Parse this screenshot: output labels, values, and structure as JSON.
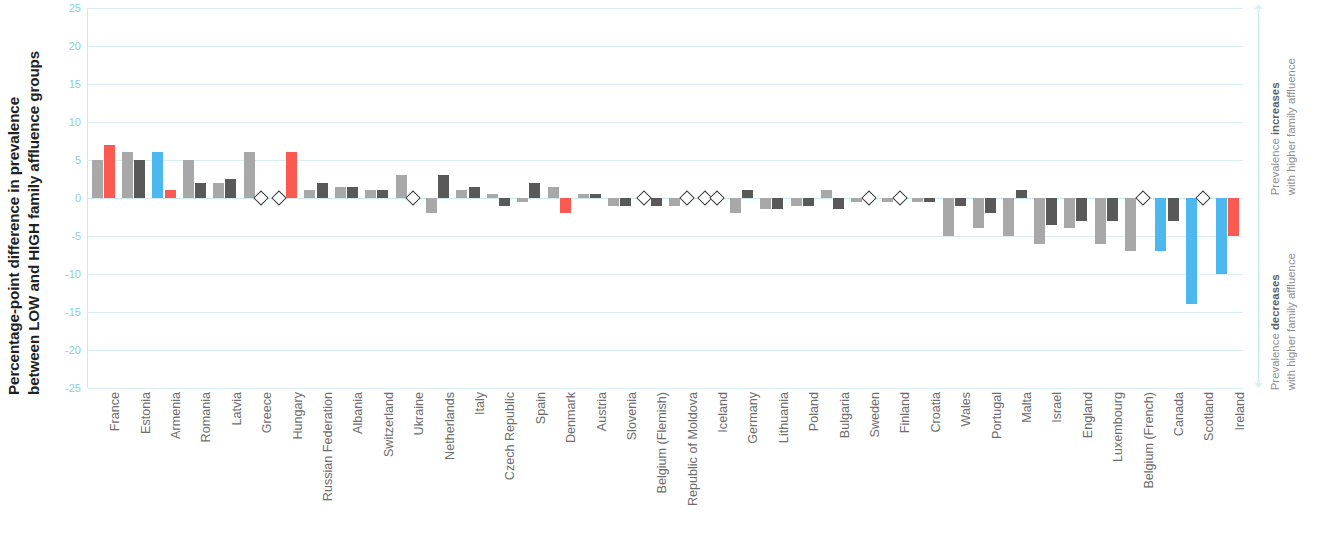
{
  "axis_title": {
    "line1": "Percentage-point difference in prevalence",
    "line2": "between LOW and HIGH family affluence groups"
  },
  "y_axis": {
    "ticks": [
      "25",
      "20",
      "15",
      "10",
      "5",
      "0",
      "-5",
      "-10",
      "-15",
      "-20",
      "-25"
    ],
    "min": -25,
    "max": 25,
    "step": 5
  },
  "annotations": {
    "top_line1_pre": "Prevalence ",
    "top_line1_bold": "increases",
    "top_line2": "with higher family affluence",
    "bottom_line1_pre": "Prevalence ",
    "bottom_line1_bold": "decreases",
    "bottom_line2": "with higher family affluence",
    "up_arrow_icon": "arrow-up-icon",
    "down_arrow_icon": "arrow-down-icon"
  },
  "colors": {
    "boys": "#a8a8a8",
    "girls": "#595959",
    "highlight_red": "#fb5a50",
    "highlight_blue": "#4db8f0",
    "grid": "#d9eef2",
    "tick_text": "#8dcfe0",
    "label_text": "#6d6d6d"
  },
  "chart_data": {
    "type": "bar",
    "title": "",
    "xlabel": "",
    "ylabel": "Percentage-point difference in prevalence between LOW and HIGH family affluence groups",
    "ylim": [
      -25,
      25
    ],
    "ytick_step": 5,
    "grid": true,
    "legend": "none",
    "zero_marker_symbol": "diamond",
    "categories": [
      "France",
      "Estonia",
      "Armenia",
      "Romania",
      "Latvia",
      "Greece",
      "Hungary",
      "Russian Federation",
      "Albania",
      "Switzerland",
      "Ukraine",
      "Netherlands",
      "Italy",
      "Czech Republic",
      "Spain",
      "Denmark",
      "Austria",
      "Slovenia",
      "Belgium (Flemish)",
      "Republic of Moldova",
      "Iceland",
      "Germany",
      "Lithuania",
      "Poland",
      "Bulgaria",
      "Sweden",
      "Finland",
      "Croatia",
      "Wales",
      "Portugal",
      "Malta",
      "Israel",
      "England",
      "Luxembourg",
      "Belgium (French)",
      "Canada",
      "Scotland",
      "Ireland"
    ],
    "series": [
      {
        "name": "Boys",
        "values": [
          5,
          6,
          6,
          5,
          2,
          6,
          0,
          1,
          1.5,
          1,
          3,
          -2,
          1,
          0.5,
          -0.5,
          1.5,
          0.5,
          -1,
          0,
          -1,
          0,
          -2,
          -1.5,
          -1,
          1,
          -0.5,
          -0.5,
          -0.5,
          -5,
          -4,
          -5,
          -6,
          -4,
          -6,
          -7,
          -7,
          -14,
          -10
        ]
      },
      {
        "name": "Girls",
        "values": [
          7,
          5,
          1,
          2,
          2.5,
          0,
          6,
          2,
          1.5,
          1,
          0,
          3,
          1.5,
          -1,
          2,
          -2,
          0.5,
          -1,
          -1,
          0,
          0,
          1,
          -1.5,
          -1,
          -1.5,
          0,
          0,
          -0.5,
          -1,
          -2,
          1,
          -3.5,
          -3,
          -3,
          0,
          -3,
          0,
          -5
        ]
      }
    ],
    "highlight_red_indices_series0": [],
    "highlight_red_indices_series1": [
      0,
      2,
      6,
      15,
      37
    ],
    "highlight_blue_indices_series0": [
      2,
      35,
      36,
      37
    ],
    "highlight_blue_indices_series1": []
  }
}
